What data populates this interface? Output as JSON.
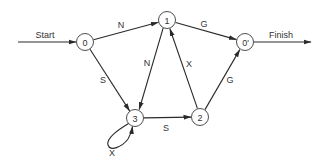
{
  "diagram": {
    "type": "state-transition-graph",
    "start_label": "Start",
    "finish_label": "Finish",
    "nodes": [
      {
        "id": "n0",
        "label": "0",
        "cx": 85,
        "cy": 42
      },
      {
        "id": "n1",
        "label": "1",
        "cx": 167,
        "cy": 20
      },
      {
        "id": "n0p",
        "label": "0'",
        "cx": 245,
        "cy": 42
      },
      {
        "id": "n3",
        "label": "3",
        "cx": 135,
        "cy": 118
      },
      {
        "id": "n2",
        "label": "2",
        "cx": 200,
        "cy": 117
      }
    ],
    "edges": [
      {
        "from": "0",
        "to": "1",
        "label": "N"
      },
      {
        "from": "1",
        "to": "0'",
        "label": "G"
      },
      {
        "from": "0",
        "to": "3",
        "label": "S"
      },
      {
        "from": "1",
        "to": "3",
        "label": "N"
      },
      {
        "from": "2",
        "to": "1",
        "label": "X"
      },
      {
        "from": "2",
        "to": "0'",
        "label": "G"
      },
      {
        "from": "3",
        "to": "2",
        "label": "S"
      },
      {
        "from": "3",
        "to": "3",
        "label": "X"
      }
    ]
  }
}
